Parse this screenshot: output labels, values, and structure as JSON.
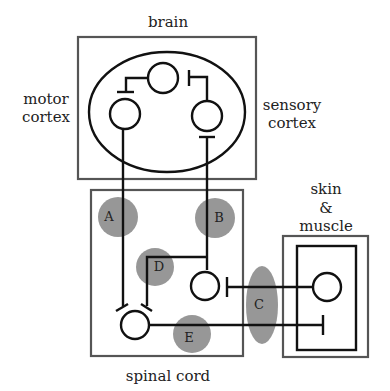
{
  "diagram": {
    "labels": {
      "brain": "brain",
      "motor_cortex_line1": "motor",
      "motor_cortex_line2": "cortex",
      "sensory_cortex_line1": "sensory",
      "sensory_cortex_line2": "cortex",
      "skin_muscle_line1": "skin",
      "skin_muscle_line2": "&",
      "skin_muscle_line3": "muscle",
      "spinal_cord": "spinal cord"
    },
    "regions": [
      {
        "id": "A",
        "label": "A"
      },
      {
        "id": "B",
        "label": "B"
      },
      {
        "id": "C",
        "label": "C"
      },
      {
        "id": "D",
        "label": "D"
      },
      {
        "id": "E",
        "label": "E"
      }
    ],
    "colors": {
      "box_stroke": "#555555",
      "neuron_stroke": "#111111",
      "region_fill": "#8c8c8c"
    }
  }
}
